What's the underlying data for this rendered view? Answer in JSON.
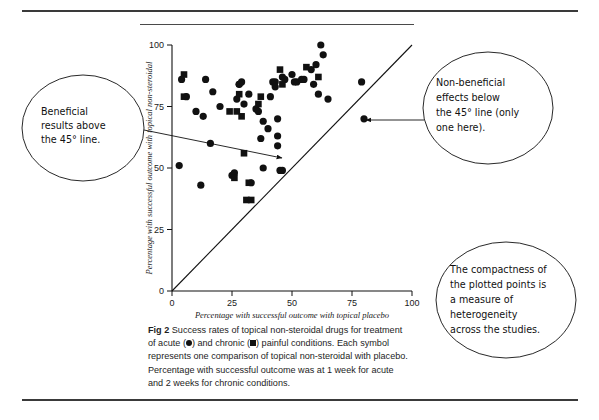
{
  "figure": {
    "label": "Fig 2",
    "caption_part1": "Success rates of topical non-steroidal drugs for treatment of acute (",
    "caption_part2": ") and chronic (",
    "caption_part3": ") painful conditions. Each symbol represents one comparison of topical non-steroidal with placebo. Percentage with successful outcome was at 1 week for acute and 2 weeks for chronic conditions."
  },
  "annotations": [
    {
      "id": "beneficial",
      "lines": [
        "Beneficial",
        "results above",
        "the 45° line."
      ]
    },
    {
      "id": "non-beneficial",
      "lines": [
        "Non-beneficial",
        "effects below",
        "the 45° line (only",
        "one here)."
      ]
    },
    {
      "id": "compactness",
      "lines": [
        "The compactness of",
        "the plotted points is",
        "a measure of",
        "heterogeneity",
        "across the studies."
      ]
    }
  ],
  "chart_data": {
    "type": "scatter",
    "title": "",
    "xlabel": "Percentage with successful outcome with topical placebo",
    "ylabel": "Percentage with successful outcome with topical non-steroidal",
    "xlim": [
      0,
      100
    ],
    "ylim": [
      0,
      100
    ],
    "xticks": [
      0,
      25,
      50,
      75,
      100
    ],
    "yticks": [
      0,
      25,
      50,
      75,
      100
    ],
    "grid": false,
    "legend": "none",
    "reference_line": {
      "name": "45° line of equality",
      "from": [
        0,
        0
      ],
      "to": [
        100,
        100
      ]
    },
    "series": [
      {
        "name": "acute",
        "marker": "circle",
        "color": "#111111",
        "points": [
          [
            3,
            51
          ],
          [
            4,
            86
          ],
          [
            6,
            79
          ],
          [
            10,
            73
          ],
          [
            12,
            43
          ],
          [
            13,
            71
          ],
          [
            14,
            86
          ],
          [
            16,
            60
          ],
          [
            17,
            81
          ],
          [
            20,
            75
          ],
          [
            25,
            47
          ],
          [
            26,
            48
          ],
          [
            27,
            78
          ],
          [
            28,
            84
          ],
          [
            28,
            84
          ],
          [
            29,
            85
          ],
          [
            30,
            76
          ],
          [
            32,
            80
          ],
          [
            33,
            44
          ],
          [
            35,
            74
          ],
          [
            36,
            73
          ],
          [
            37,
            62
          ],
          [
            38,
            50
          ],
          [
            38,
            69
          ],
          [
            40,
            66
          ],
          [
            41,
            79
          ],
          [
            42,
            85
          ],
          [
            43,
            85
          ],
          [
            43,
            83
          ],
          [
            44,
            70
          ],
          [
            44,
            63
          ],
          [
            44,
            59
          ],
          [
            45,
            49
          ],
          [
            46,
            49
          ],
          [
            46,
            87
          ],
          [
            47,
            86
          ],
          [
            50,
            88
          ],
          [
            51,
            85
          ],
          [
            52,
            85
          ],
          [
            54,
            86
          ],
          [
            55,
            86
          ],
          [
            58,
            90
          ],
          [
            59,
            84
          ],
          [
            60,
            92
          ],
          [
            61,
            80
          ],
          [
            62,
            100
          ],
          [
            63,
            96
          ],
          [
            65,
            78
          ],
          [
            79,
            85
          ],
          [
            80,
            70
          ]
        ]
      },
      {
        "name": "chronic",
        "marker": "square",
        "color": "#111111",
        "points": [
          [
            5,
            88
          ],
          [
            5,
            79
          ],
          [
            24,
            73
          ],
          [
            26,
            46
          ],
          [
            27,
            73
          ],
          [
            28,
            80
          ],
          [
            29,
            71
          ],
          [
            30,
            56
          ],
          [
            31,
            37
          ],
          [
            32,
            44
          ],
          [
            33,
            37
          ],
          [
            36,
            76
          ],
          [
            37,
            79
          ],
          [
            45,
            90
          ],
          [
            46,
            84
          ],
          [
            56,
            91
          ],
          [
            61,
            87
          ]
        ]
      }
    ]
  }
}
